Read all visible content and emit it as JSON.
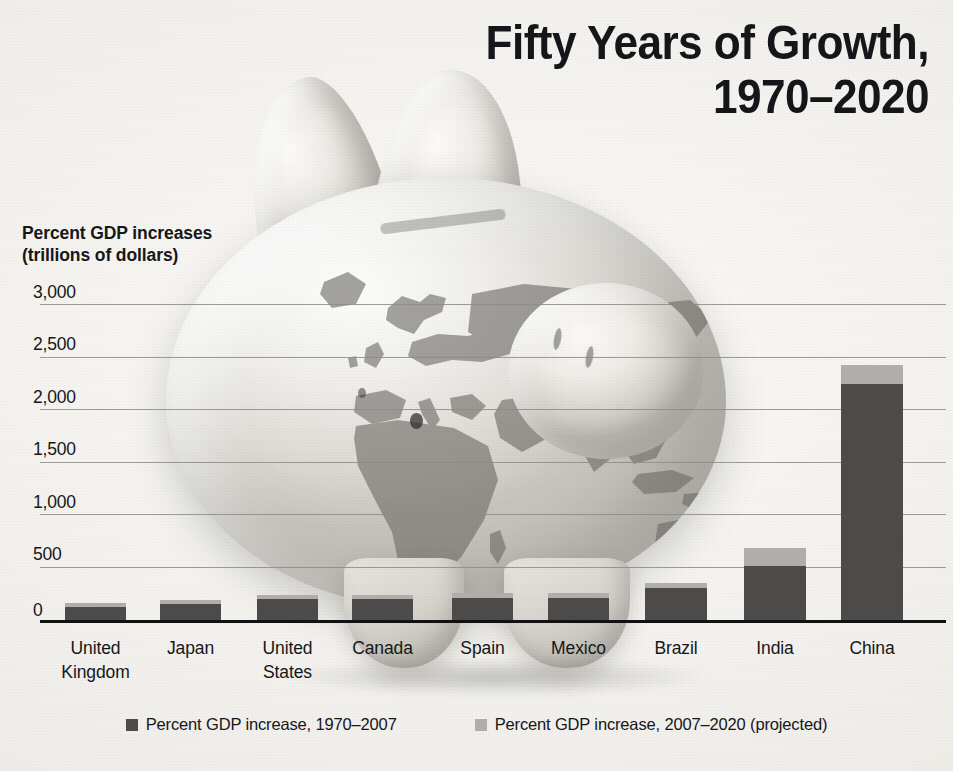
{
  "title": "Fifty Years of Growth,\n1970–2020",
  "axis_caption": "Percent GDP increases\n(trillions of dollars)",
  "legend": [
    {
      "label": "Percent GDP increase, 1970–2007",
      "color": "#4c4b49",
      "swatch_name": "legend-swatch-historical"
    },
    {
      "label": "Percent GDP increase, 2007–2020 (projected)",
      "color": "#b0aeaa",
      "swatch_name": "legend-swatch-projected"
    }
  ],
  "yticks": [
    "3,000",
    "2,500",
    "2,000",
    "1,500",
    "1,000",
    "500",
    "0"
  ],
  "xlabels": [
    "United\nKingdom",
    "Japan",
    "United\nStates",
    "Canada",
    "Spain",
    "Mexico",
    "Brazil",
    "India",
    "China"
  ],
  "colors": {
    "historical": "#4c4b49",
    "projected": "#b0aeaa",
    "gridline": "#8d8b86",
    "axis": "#111114",
    "text": "#16161a",
    "background": "#f2f1ee"
  },
  "chart_data": {
    "type": "bar",
    "title": "Fifty Years of Growth, 1970–2020",
    "subtitle": "",
    "xlabel": "",
    "ylabel": "Percent GDP increases (trillions of dollars)",
    "ylim": [
      0,
      3000
    ],
    "yticks": [
      0,
      500,
      1000,
      1500,
      2000,
      2500,
      3000
    ],
    "grid": true,
    "stacked": true,
    "legend_position": "bottom",
    "categories": [
      "United Kingdom",
      "Japan",
      "United States",
      "Canada",
      "Spain",
      "Mexico",
      "Brazil",
      "India",
      "China"
    ],
    "series": [
      {
        "name": "Percent GDP increase, 1970–2007",
        "color": "#4c4b49",
        "values": [
          125,
          150,
          200,
          200,
          210,
          210,
          305,
          515,
          2245
        ]
      },
      {
        "name": "Percent GDP increase, 2007–2020 (projected)",
        "color": "#b0aeaa",
        "values": [
          40,
          40,
          40,
          40,
          45,
          45,
          50,
          170,
          180
        ]
      }
    ],
    "totals": [
      165,
      190,
      240,
      240,
      255,
      255,
      355,
      685,
      2425
    ]
  },
  "bar_layout": [
    {
      "name": "united-kingdom",
      "x": 65,
      "width": 61
    },
    {
      "name": "japan",
      "x": 160,
      "width": 61
    },
    {
      "name": "united-states",
      "x": 257,
      "width": 61
    },
    {
      "name": "canada",
      "x": 352,
      "width": 61
    },
    {
      "name": "spain",
      "x": 452,
      "width": 61
    },
    {
      "name": "mexico",
      "x": 548,
      "width": 61
    },
    {
      "name": "brazil",
      "x": 645,
      "width": 62
    },
    {
      "name": "india",
      "x": 744,
      "width": 62
    },
    {
      "name": "china",
      "x": 841,
      "width": 62
    }
  ],
  "photo": {
    "name": "piggy-bank-with-world-map",
    "alt": "Piggy bank printed with a world map"
  }
}
